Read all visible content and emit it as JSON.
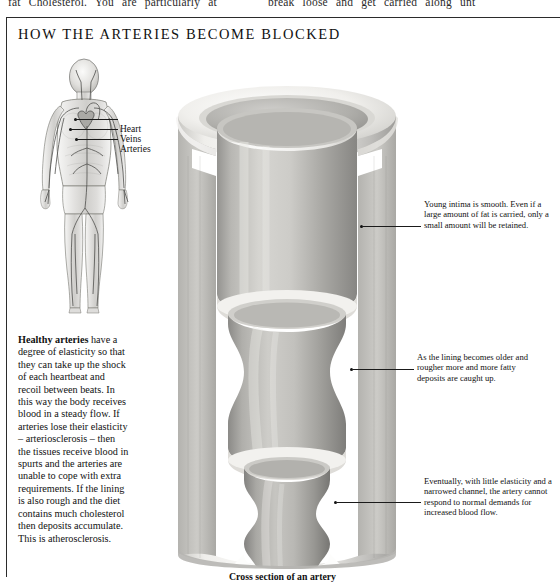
{
  "page_top_text": {
    "left_fragment": "fat Cholesterol. You are particularly at",
    "right_fragment": "break  loose  and  get  carried  along  unt"
  },
  "figure": {
    "title": "HOW THE ARTERIES BECOME BLOCKED",
    "caption": "Cross section of an artery",
    "human_figure": {
      "name": "circulatory-system-figure",
      "labels": [
        {
          "id": "heart",
          "text": "Heart"
        },
        {
          "id": "veins",
          "text": "Veins"
        },
        {
          "id": "arteries",
          "text": "Arteries"
        }
      ]
    },
    "left_paragraph": {
      "lead_bold": "Healthy arteries",
      "body": " have a degree of elasticity so that they can take up the shock of each heartbeat and recoil between beats. In this way the body receives blood in a steady flow. If arteries lose their elasticity – arteriosclerosis – then the tissues receive blood in spurts and the arteries are unable to cope with extra requirements. If the lining is also rough and the diet contains much cholesterol then deposits accumulate. This is atherosclerosis."
    },
    "annotations": [
      {
        "id": "annotation-young-intima",
        "text": "Young intima is smooth. Even if a large amount of fat is carried, only a small amount will be retained."
      },
      {
        "id": "annotation-lining-older",
        "text": "As the lining becomes older and rougher more and more fatty deposits are caught up."
      },
      {
        "id": "annotation-narrowed-channel",
        "text": "Eventually, with little elasticity and a narrowed channel, the artery cannot respond to normal demands for increased blood flow."
      }
    ]
  },
  "colors": {
    "frame_border": "#2b2b2b",
    "text": "#111111",
    "artery_wall_light": "#f2f1ee",
    "artery_wall_mid": "#c9c8c4",
    "artery_lumen_dark": "#8d8c88",
    "page_background": "#ffffff"
  }
}
